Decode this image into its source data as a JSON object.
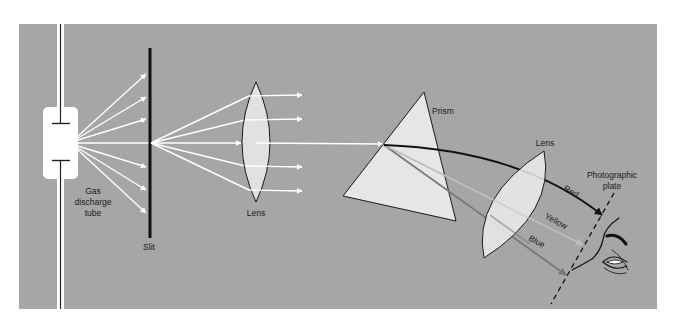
{
  "diagram": {
    "colors": {
      "background": "#a6a6a6",
      "page": "#ffffff",
      "beam": "#ffffff",
      "optic_fill": "#e6e6e6",
      "outline": "#1a1a1a",
      "red_ray": "#111111",
      "yellow_ray": "#bdbdbd",
      "blue_ray": "#777777"
    },
    "labels": {
      "tube_line1": "Gas",
      "tube_line2": "discharge",
      "tube_line3": "tube",
      "slit": "Slit",
      "lens1": "Lens",
      "prism": "Prism",
      "lens2": "Lens",
      "plate_line1": "Photographic",
      "plate_line2": "plate",
      "red": "Red",
      "yellow": "Yellow",
      "blue": "Blue"
    },
    "components": [
      {
        "name": "gas-discharge-tube"
      },
      {
        "name": "slit"
      },
      {
        "name": "collimating-lens"
      },
      {
        "name": "prism"
      },
      {
        "name": "focusing-lens"
      },
      {
        "name": "photographic-plate"
      },
      {
        "name": "eye"
      }
    ],
    "rays": [
      {
        "name": "Red",
        "color": "#111111"
      },
      {
        "name": "Yellow",
        "color": "#bdbdbd"
      },
      {
        "name": "Blue",
        "color": "#777777"
      }
    ]
  }
}
